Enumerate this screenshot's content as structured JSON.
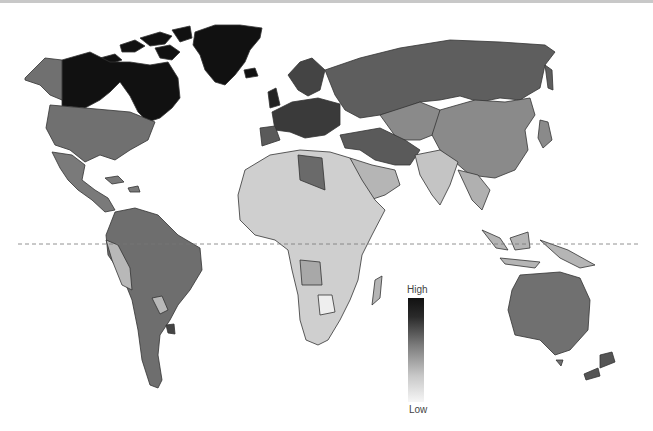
{
  "map": {
    "title": "",
    "projection": "world choropleth (grayscale)",
    "equator_line": "dashed",
    "colors": {
      "darkest": "#111111",
      "dark": "#3a3a3a",
      "mid_dark": "#5a5a5a",
      "mid": "#707070",
      "mid_light": "#8a8a8a",
      "light": "#b5b5b5",
      "lighter": "#cfcfcf",
      "lightest": "#e8e8e8",
      "border": "#333333"
    },
    "regions": [
      {
        "name": "Canada",
        "shade": "darkest"
      },
      {
        "name": "Greenland",
        "shade": "darkest"
      },
      {
        "name": "Alaska / USA",
        "shade": "mid"
      },
      {
        "name": "Mexico & Central America",
        "shade": "mid"
      },
      {
        "name": "South America",
        "shade": "mid"
      },
      {
        "name": "Western Europe",
        "shade": "dark"
      },
      {
        "name": "Russia",
        "shade": "mid_dark"
      },
      {
        "name": "China",
        "shade": "mid_light"
      },
      {
        "name": "Middle East",
        "shade": "mid_dark"
      },
      {
        "name": "India / SE Asia",
        "shade": "light"
      },
      {
        "name": "Africa",
        "shade": "lighter"
      },
      {
        "name": "Australia / NZ",
        "shade": "mid"
      }
    ]
  },
  "legend": {
    "high_label": "High",
    "low_label": "Low"
  }
}
